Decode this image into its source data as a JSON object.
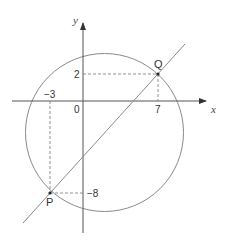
{
  "diagram": {
    "axes": {
      "x_label": "x",
      "y_label": "y",
      "origin_label": "0"
    },
    "tick_labels": {
      "x_pos": "7",
      "x_neg": "−3",
      "y_pos": "2",
      "y_neg": "−8"
    },
    "points": {
      "P": {
        "label": "P",
        "x": -3,
        "y": -8
      },
      "Q": {
        "label": "Q",
        "x": 7,
        "y": 2
      }
    },
    "shapes": [
      "circle",
      "line through P and Q",
      "dashed projections to axes"
    ],
    "colors": {
      "stroke": "#8a8a8a",
      "axis": "#555555",
      "text": "#333333"
    }
  }
}
